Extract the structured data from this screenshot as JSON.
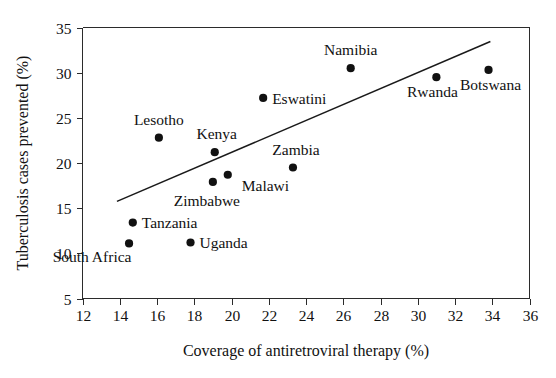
{
  "chart_data": {
    "type": "scatter",
    "title": "",
    "xlabel": "Coverage of antiretroviral therapy (%)",
    "ylabel": "Tuberculosis cases prevented (%)",
    "xlim": [
      12,
      36
    ],
    "ylim": [
      5,
      35
    ],
    "xticks": [
      12,
      14,
      16,
      18,
      20,
      22,
      24,
      26,
      28,
      30,
      32,
      34,
      36
    ],
    "yticks": [
      5,
      10,
      15,
      20,
      25,
      30,
      35
    ],
    "xticklabels": [
      "12",
      "14",
      "16",
      "18",
      "20",
      "22",
      "24",
      "26",
      "28",
      "30",
      "32",
      "34",
      "36"
    ],
    "yticklabels": [
      "5",
      "10",
      "15",
      "20",
      "25",
      "30",
      "35"
    ],
    "grid": false,
    "legend": false,
    "marker_color": "#111111",
    "line_color": "#1a1a1a",
    "axis_color": "#2b2b2b",
    "points": [
      {
        "label": "South Africa",
        "x": 14.5,
        "y": 11.1,
        "label_dx": -37,
        "label_dy": 19,
        "label_anchor": "middle"
      },
      {
        "label": "Tanzania",
        "x": 14.7,
        "y": 13.4,
        "label_dx": 9,
        "label_dy": 5,
        "label_anchor": "start"
      },
      {
        "label": "Lesotho",
        "x": 16.1,
        "y": 22.8,
        "label_dx": 0,
        "label_dy": -13,
        "label_anchor": "middle"
      },
      {
        "label": "Uganda",
        "x": 17.8,
        "y": 11.2,
        "label_dx": 9,
        "label_dy": 6,
        "label_anchor": "start"
      },
      {
        "label": "Zimbabwe",
        "x": 19.0,
        "y": 17.9,
        "label_dx": -6,
        "label_dy": 24,
        "label_anchor": "middle"
      },
      {
        "label": "Kenya",
        "x": 19.1,
        "y": 21.2,
        "label_dx": 2,
        "label_dy": -13,
        "label_anchor": "middle"
      },
      {
        "label": "Malawi",
        "x": 19.8,
        "y": 18.7,
        "label_dx": 14,
        "label_dy": 16,
        "label_anchor": "start"
      },
      {
        "label": "Eswatini",
        "x": 21.7,
        "y": 27.2,
        "label_dx": 9,
        "label_dy": 6,
        "label_anchor": "start"
      },
      {
        "label": "Zambia",
        "x": 23.3,
        "y": 19.5,
        "label_dx": 3,
        "label_dy": -13,
        "label_anchor": "middle"
      },
      {
        "label": "Namibia",
        "x": 26.4,
        "y": 30.5,
        "label_dx": 0,
        "label_dy": -13,
        "label_anchor": "middle"
      },
      {
        "label": "Rwanda",
        "x": 31.0,
        "y": 29.5,
        "label_dx": -4,
        "label_dy": 20,
        "label_anchor": "middle"
      },
      {
        "label": "Botswana",
        "x": 33.8,
        "y": 30.3,
        "label_dx": 2,
        "label_dy": 20,
        "label_anchor": "middle"
      }
    ],
    "trendline": {
      "x_start": 13.85,
      "y_start": 15.75,
      "x_end": 33.9,
      "y_end": 33.45
    }
  }
}
